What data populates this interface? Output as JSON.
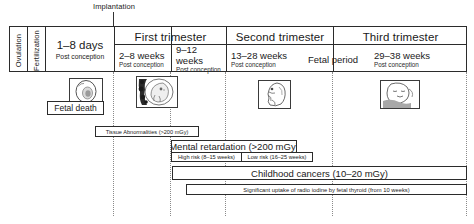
{
  "annotation": {
    "implantation": "Implantation"
  },
  "timeline": {
    "events": [
      {
        "label": "Ovulation",
        "orientation": "vertical"
      },
      {
        "label": "Fertilization",
        "orientation": "vertical"
      }
    ],
    "preimplantation": {
      "main": "1–8 days",
      "sub": "Post conception"
    },
    "trimesters": [
      {
        "title": "First trimester",
        "periods": [
          {
            "main": "2–8 weeks",
            "sub": "Post conception"
          },
          {
            "main": "9–12 weeks",
            "sub": "Post conception"
          }
        ]
      },
      {
        "title": "Second trimester",
        "periods": [
          {
            "main": "13–28 weeks",
            "sub": "Post conception"
          }
        ]
      },
      {
        "title": "Third trimester",
        "periods": [
          {
            "main": "29–38 weeks",
            "sub": "Post conception"
          }
        ]
      }
    ],
    "fetal_period_label": "Fetal period"
  },
  "figures": [
    {
      "name": "blastocyst-illustration",
      "stage": "1–8 days"
    },
    {
      "name": "embryo-illustration",
      "stage": "2–8 weeks"
    },
    {
      "name": "fetus-illustration",
      "stage": "13–28 weeks"
    },
    {
      "name": "late-fetus-illustration",
      "stage": "29–38 weeks"
    }
  ],
  "risk_bars": {
    "fetal_death": "Fetal death",
    "tissue_abnormalities": "Tissue Abnormalities (>200 mGy)",
    "mental_retardation": "Mental retardation (>200 mGy)",
    "high_risk": "High risk (8–15 weeks)",
    "low_risk": "Low risk (16–25 weeks)",
    "childhood_cancers": "Childhood cancers (10–20 mGy)",
    "radio_iodine": "Significant uptake of radio iodine by fetal thyroid (from 10 weeks)"
  },
  "colors": {
    "line": "#2b2b2b",
    "guide": "#8a8a8a",
    "background": "#ffffff"
  }
}
